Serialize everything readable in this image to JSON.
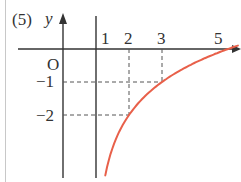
{
  "problem_label": "(5)",
  "chart_data": {
    "type": "line",
    "title": "",
    "xlabel": "x",
    "ylabel": "y",
    "origin_label": "O",
    "function": "y = log2(x - 1) - 2",
    "asymptote": {
      "x": 1,
      "label": "1"
    },
    "x_ticks": [
      {
        "value": 1,
        "label": "1"
      },
      {
        "value": 2,
        "label": "2"
      },
      {
        "value": 3,
        "label": "3"
      },
      {
        "value": 5,
        "label": "5"
      }
    ],
    "y_ticks": [
      {
        "value": -1,
        "label": "−1"
      },
      {
        "value": -2,
        "label": "−2"
      }
    ],
    "key_points": [
      {
        "x": 2,
        "y": -2
      },
      {
        "x": 3,
        "y": -1
      },
      {
        "x": 5,
        "y": 0
      }
    ],
    "series": [
      {
        "name": "curve",
        "color": "#e8604a",
        "x": [
          1.07,
          1.1,
          1.2,
          1.35,
          1.5,
          1.75,
          2,
          2.5,
          3,
          3.5,
          4,
          4.5,
          5,
          5.3
        ],
        "y": [
          -5.84,
          -5.32,
          -4.32,
          -3.51,
          -3.0,
          -2.42,
          -2.0,
          -1.42,
          -1.0,
          -0.68,
          -0.42,
          -0.19,
          0.0,
          0.1
        ]
      }
    ],
    "grid": false,
    "guide_lines": "dashed lines from (2,-2) and (3,-1) to both axes"
  },
  "colors": {
    "axis": "#333333",
    "curve": "#e8604a",
    "guide": "#555555"
  }
}
